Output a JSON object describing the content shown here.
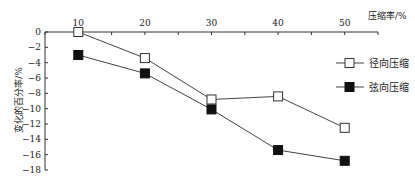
{
  "chart_data": {
    "type": "line",
    "title": "",
    "xlabel": "压缩率/%",
    "ylabel": "变化的百分率/%",
    "x": [
      10,
      20,
      30,
      40,
      50
    ],
    "xlim": [
      5,
      55
    ],
    "ylim": [
      -18,
      0
    ],
    "yticks": [
      0,
      -2,
      -4,
      -6,
      -8,
      -10,
      -12,
      -14,
      -16,
      -18
    ],
    "xticks": [
      10,
      20,
      30,
      40,
      50
    ],
    "x_axis_position": "top",
    "grid": false,
    "legend_position": "right",
    "series": [
      {
        "name": "径向压缩",
        "marker": "open-square",
        "color": "#333333",
        "values": [
          0,
          -3.4,
          -8.8,
          -8.4,
          -12.5
        ]
      },
      {
        "name": "弦向压缩",
        "marker": "filled-square",
        "color": "#111111",
        "values": [
          -3,
          -5.4,
          -10.1,
          -15.4,
          -16.8
        ]
      }
    ]
  }
}
